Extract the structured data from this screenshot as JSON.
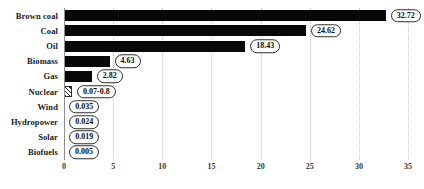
{
  "chart_data": {
    "type": "bar",
    "orientation": "horizontal",
    "title": "",
    "subtitle": "",
    "xlabel": "",
    "ylabel": "",
    "xlim": [
      0,
      35.6
    ],
    "ylim": null,
    "grid": true,
    "grid_axis": "x",
    "legend": null,
    "xticks": [
      0,
      5,
      10,
      15,
      20,
      25,
      30,
      35
    ],
    "xticklabels": [
      "0",
      "5",
      "10",
      "15",
      "20",
      "25",
      "30",
      "35"
    ],
    "categories": [
      "Brown coal",
      "Coal",
      "Oil",
      "Biomass",
      "Gas",
      "Nuclear",
      "Wind",
      "Hydropower",
      "Solar",
      "Biofuels"
    ],
    "values": [
      32.72,
      24.62,
      18.43,
      4.63,
      2.82,
      0.8,
      0.035,
      0.024,
      0.019,
      0.005
    ],
    "value_labels": [
      "32.72",
      "24.62",
      "18.43",
      "4.63",
      "2.82",
      "0.07-0.8",
      "0.035",
      "0.024",
      "0.019",
      "0.005"
    ],
    "bar_styles": [
      "solid",
      "solid",
      "solid",
      "solid",
      "solid",
      "hatched",
      "solid",
      "solid",
      "solid",
      "solid"
    ],
    "colors": {
      "bar_fill": "#080808",
      "hatch_stroke": "#2a2a2a",
      "gridline": "#c9c9c9",
      "axis_line": "#8f8f8f",
      "label_text": "#1a1a1a",
      "tick_text": "#3a3a3a",
      "background": "#ffffff"
    }
  }
}
